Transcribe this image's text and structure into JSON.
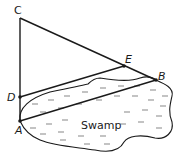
{
  "diagram": {
    "points": {
      "C": {
        "label": "C",
        "x": 20,
        "y": 18
      },
      "D": {
        "label": "D",
        "x": 20,
        "y": 97
      },
      "A": {
        "label": "A",
        "x": 20,
        "y": 121
      },
      "E": {
        "label": "E",
        "x": 124,
        "y": 66
      },
      "B": {
        "label": "B",
        "x": 156,
        "y": 80
      }
    },
    "segments": [
      "CA",
      "CB",
      "DE",
      "AB"
    ],
    "region_label": "Swamp",
    "colors": {
      "line": "#1a1a1a",
      "swamp_marks": "#555555",
      "background": "#ffffff"
    }
  }
}
